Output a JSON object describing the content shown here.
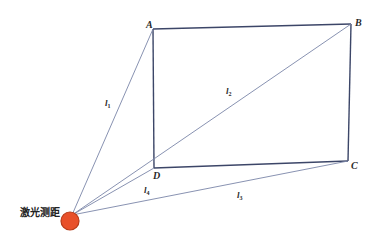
{
  "diagram": {
    "type": "laser-ranging-geometry",
    "colors": {
      "rectangle_edge": "#3c4668",
      "ray": "#7a86a8",
      "laser_fill": "#e8502a",
      "laser_stroke": "#b83a18",
      "text": "#2a2a2a",
      "background": "#ffffff"
    },
    "vertices": {
      "A": {
        "label": "A",
        "x": 153,
        "y": 29
      },
      "B": {
        "label": "B",
        "x": 351,
        "y": 24
      },
      "C": {
        "label": "C",
        "x": 348,
        "y": 161
      },
      "D": {
        "label": "D",
        "x": 154,
        "y": 168
      }
    },
    "laser": {
      "label": "激光测距",
      "origin": {
        "x": 72,
        "y": 215
      },
      "marker": {
        "cx": 70,
        "cy": 221,
        "r": 9
      }
    },
    "rays": [
      {
        "id": "l1",
        "label_main": "l",
        "label_sub": "1",
        "to": "A",
        "label_x": 105,
        "label_y": 106
      },
      {
        "id": "l2",
        "label_main": "l",
        "label_sub": "2",
        "to": "B",
        "label_x": 226,
        "label_y": 94
      },
      {
        "id": "l3",
        "label_main": "l",
        "label_sub": "3",
        "to": "C",
        "label_x": 237,
        "label_y": 198
      },
      {
        "id": "l4",
        "label_main": "l",
        "label_sub": "4",
        "to": "D",
        "label_x": 144,
        "label_y": 193
      }
    ]
  }
}
